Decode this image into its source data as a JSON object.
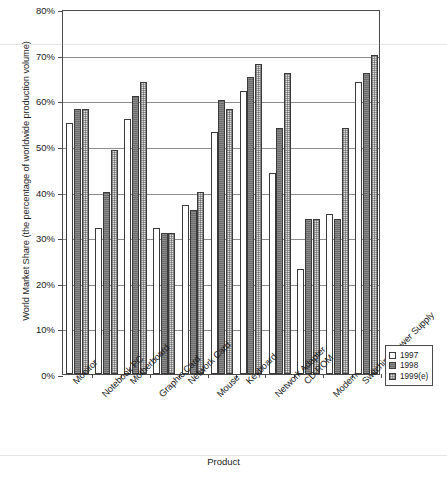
{
  "chart_data": {
    "type": "bar",
    "title": "",
    "xlabel": "Product",
    "ylabel": "World Market Share (the percentage of worldwide production volume)",
    "ylim": [
      0,
      80
    ],
    "ytick_values": [
      0,
      10,
      20,
      30,
      40,
      50,
      60,
      70,
      80
    ],
    "ytick_labels": [
      "0%",
      "10%",
      "20%",
      "30%",
      "40%",
      "50%",
      "60%",
      "70%",
      "80%"
    ],
    "grid": true,
    "legend_position": "bottom-right",
    "categories": [
      "Monitor",
      "Notebook PC",
      "Motherboard",
      "Graphic Card",
      "Network Card",
      "Mouse",
      "Keyboard",
      "Network Adapter",
      "CD ROM",
      "Modem",
      "Switching Power Supply"
    ],
    "series": [
      {
        "name": "1997",
        "values": [
          55,
          32,
          56,
          32,
          37,
          53,
          62,
          44,
          23,
          35,
          64
        ]
      },
      {
        "name": "1998",
        "values": [
          58,
          40,
          61,
          31,
          36,
          60,
          65,
          54,
          34,
          34,
          66
        ]
      },
      {
        "name": "1999(e)",
        "values": [
          58,
          49,
          64,
          31,
          40,
          58,
          68,
          66,
          34,
          54,
          70
        ]
      }
    ]
  },
  "legend": {
    "items": [
      {
        "label": "1997"
      },
      {
        "label": "1998"
      },
      {
        "label": "1999(e)"
      }
    ]
  }
}
